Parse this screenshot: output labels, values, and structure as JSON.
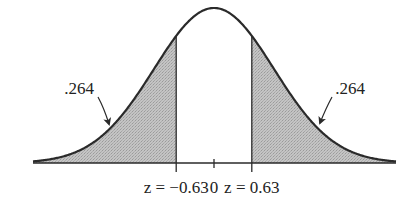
{
  "figure": {
    "colors": {
      "curve": "#2a2a2a",
      "shade": "#c4c4c4",
      "shade_dots": "#9a9a9a",
      "background": "#ffffff",
      "text": "#222222"
    }
  },
  "axis": {
    "labels": [
      {
        "id": "left",
        "text": "z = −0.63",
        "z": -0.63
      },
      {
        "id": "center",
        "text": "0",
        "z": 0
      },
      {
        "id": "right",
        "text": "z = 0.63",
        "z": 0.63
      }
    ]
  },
  "annotations": {
    "left_tail": {
      "text": ".264",
      "area": 0.264
    },
    "right_tail": {
      "text": ".264",
      "area": 0.264
    }
  },
  "geometry": {
    "center_x": 214,
    "baseline_y": 163,
    "peak_y": 8,
    "sigma_px": 60,
    "x_start": 33,
    "x_end": 396,
    "cut_z": 0.63
  }
}
